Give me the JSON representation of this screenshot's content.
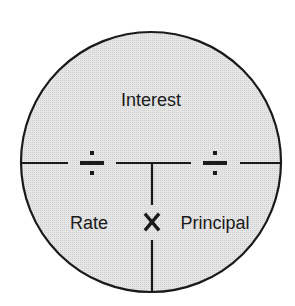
{
  "diagram": {
    "background_color": "#ffffff",
    "circle_fill": "#e4e4e4",
    "stroke_color": "#1a1a1a",
    "labels": {
      "top": "Interest",
      "bottom_left": "Rate",
      "bottom_right": "Principal"
    },
    "operators": {
      "left_divide": "÷",
      "right_divide": "÷",
      "multiply": "×"
    }
  }
}
